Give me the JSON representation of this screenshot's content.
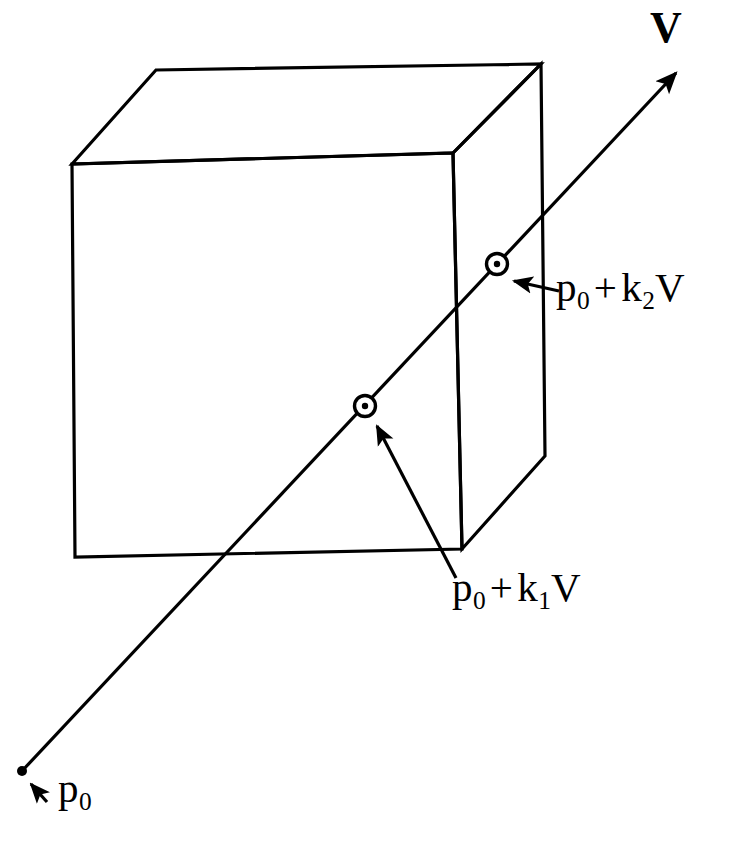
{
  "figure": {
    "background_color": "#ffffff",
    "stroke_color": "#000000",
    "width": 742,
    "height": 852
  },
  "box": {
    "name": "axis-aligned-box",
    "top_face": [
      [
        156,
        70
      ],
      [
        541,
        64
      ],
      [
        453,
        153
      ],
      [
        72,
        164
      ]
    ],
    "front_face": [
      [
        72,
        164
      ],
      [
        453,
        153
      ],
      [
        462,
        549
      ],
      [
        75,
        557
      ]
    ],
    "right_face": [
      [
        453,
        153
      ],
      [
        541,
        64
      ],
      [
        545,
        456
      ],
      [
        462,
        549
      ]
    ]
  },
  "ray": {
    "name": "ray-p0-direction-V",
    "origin_point": [
      22,
      771
    ],
    "arrow_tip": [
      680,
      68
    ],
    "origin_marker": "filled-dot",
    "intersection_markers": [
      "circle-dot",
      "circle-dot"
    ]
  },
  "points": [
    {
      "id": "p0",
      "marker": "filled-dot",
      "x": 22,
      "y": 771,
      "label_text": "p",
      "label_sub": "0",
      "label_x": 58,
      "label_y": 762,
      "pointer_from": [
        46,
        801
      ],
      "pointer_to": [
        30,
        782
      ]
    },
    {
      "id": "p0-plus-k1-V",
      "marker": "circle-dot",
      "x": 365,
      "y": 406,
      "label_x": 452,
      "label_y": 565,
      "pointer_from": [
        456,
        578
      ],
      "pointer_to": [
        376,
        424
      ]
    },
    {
      "id": "p0-plus-k2-V",
      "marker": "circle-dot",
      "x": 497,
      "y": 264,
      "label_x": 556,
      "label_y": 265,
      "pointer_from": [
        558,
        291
      ],
      "pointer_to": [
        512,
        280
      ]
    }
  ],
  "labels": {
    "vector_V": {
      "text": "V",
      "x": 650,
      "y": 8
    },
    "k1_label": {
      "base": "p",
      "sub0": "0",
      "op": "+",
      "k": "k",
      "sub_k": "1",
      "vec": "V"
    },
    "k2_label": {
      "base": "p",
      "sub0": "0",
      "op": "+",
      "k": "k",
      "sub_k": "2",
      "vec": "V"
    },
    "p0_label": {
      "base": "p",
      "sub0": "0"
    }
  }
}
